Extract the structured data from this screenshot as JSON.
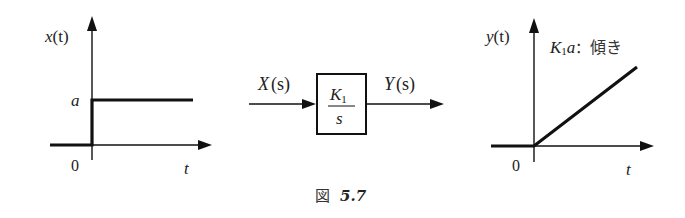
{
  "figure": {
    "caption_prefix": "図",
    "caption_number": "5.7"
  },
  "input_graph": {
    "y_label_fn": "x",
    "y_label_arg": "(t)",
    "level_label": "a",
    "origin_label": "0",
    "x_label": "t",
    "signal": "step"
  },
  "block_diagram": {
    "input_label_fn": "X",
    "input_label_arg": "(s)",
    "output_label_fn": "Y",
    "output_label_arg": "(s)",
    "transfer_numerator": "K",
    "transfer_numerator_sub": "1",
    "transfer_denominator": "s"
  },
  "output_graph": {
    "y_label_fn": "y",
    "y_label_arg": "(t)",
    "slope_label_var": "K",
    "slope_label_sub": "1",
    "slope_label_a": "a",
    "slope_label_sep": "：",
    "slope_label_text": "傾き",
    "origin_label": "0",
    "x_label": "t",
    "signal": "ramp"
  },
  "colors": {
    "line": "#111111",
    "background": "#ffffff"
  }
}
